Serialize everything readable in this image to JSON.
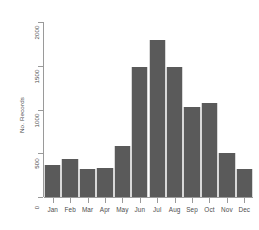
{
  "chart_data": {
    "type": "bar",
    "title": "",
    "xlabel": "",
    "ylabel": "No. Records",
    "categories": [
      "Jan",
      "Feb",
      "Mar",
      "Apr",
      "May",
      "Jun",
      "Jul",
      "Aug",
      "Sep",
      "Oct",
      "Nov",
      "Dec"
    ],
    "values": [
      370,
      440,
      320,
      330,
      580,
      1490,
      1800,
      1490,
      1030,
      1080,
      500,
      320
    ],
    "ylim": [
      0,
      2000
    ],
    "yticks": [
      0,
      500,
      1000,
      1500,
      2000
    ],
    "ytick_labels": [
      "0",
      "500",
      "1000",
      "1500",
      "2000"
    ],
    "grid": false,
    "legend": false,
    "bar_color": "#5a5a5a",
    "axis_color": "#9a9a9a",
    "text_color": "#4d4d4d"
  },
  "axes": {
    "y_title": "No. Records"
  }
}
